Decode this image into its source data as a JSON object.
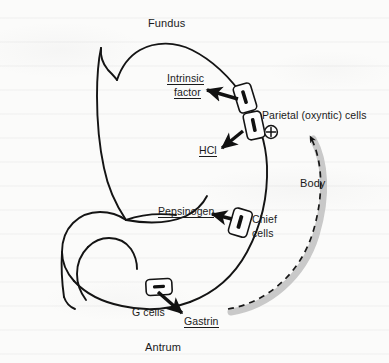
{
  "figure": {
    "type": "anatomical-diagram",
    "background_color": "#fbfbfa",
    "ink_color": "#1a1a1a",
    "shadow_color": "#b9b9b9"
  },
  "region_labels": {
    "fundus": "Fundus",
    "body": "Body",
    "antrum": "Antrum"
  },
  "cell_labels": {
    "parietal": "Parietal (oxyntic) cells",
    "chief_line1": "Chief",
    "chief_line2": "cells",
    "g_cells": "G cells"
  },
  "secretion_labels": {
    "intrinsic_factor_line1": "Intrinsic",
    "intrinsic_factor_line2": "factor",
    "hcl": "HCl",
    "pepsinogen": "Pepsinogen",
    "gastrin": "Gastrin"
  },
  "symbols": {
    "stimulation": "⊕",
    "stimulation_name": "plus-circle-stimulatory"
  },
  "connections": [
    {
      "from": "parietal-cell-upper",
      "to": "Intrinsic factor",
      "style": "solid-arrow"
    },
    {
      "from": "parietal-cell-lower",
      "to": "HCl",
      "style": "solid-arrow"
    },
    {
      "from": "chief-cell",
      "to": "Pepsinogen",
      "style": "solid-arrow"
    },
    {
      "from": "g-cell",
      "to": "Gastrin",
      "style": "solid-arrow"
    },
    {
      "from": "Gastrin",
      "to": "plus-circle-stimulatory",
      "style": "dashed-arrow-feedback"
    }
  ]
}
